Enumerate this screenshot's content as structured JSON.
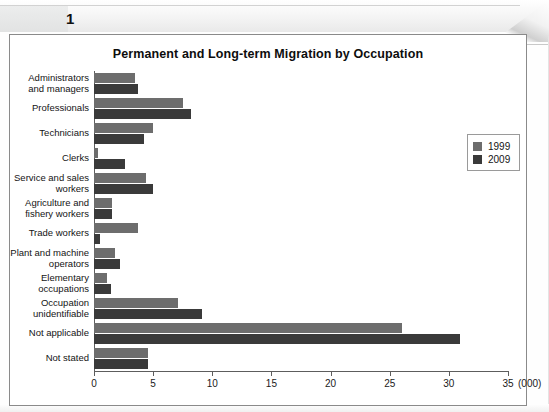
{
  "page": {
    "number": "1"
  },
  "figure": {
    "title": "Permanent and Long-term Migration by Occupation",
    "x_unit": "(000)"
  },
  "legend": {
    "items": [
      {
        "label": "1999",
        "color": "#6d6d6d"
      },
      {
        "label": "2009",
        "color": "#3a3a3a"
      }
    ]
  },
  "axis": {
    "ticks": [
      "0",
      "5",
      "10",
      "15",
      "20",
      "25",
      "30",
      "35"
    ]
  },
  "chart_data": {
    "type": "bar",
    "orientation": "horizontal",
    "title": "Permanent and Long-term Migration by Occupation",
    "xlabel": "(000)",
    "ylabel": "",
    "xlim": [
      0,
      35
    ],
    "xticks": [
      0,
      5,
      10,
      15,
      20,
      25,
      30,
      35
    ],
    "grid": false,
    "legend_position": "upper right",
    "categories": [
      "Administrators\nand managers",
      "Professionals",
      "Technicians",
      "Clerks",
      "Service and sales\nworkers",
      "Agriculture and\nfishery workers",
      "Trade workers",
      "Plant and machine\noperators",
      "Elementary\noccupations",
      "Occupation\nunidentifiable",
      "Not applicable",
      "Not stated"
    ],
    "series": [
      {
        "name": "1999",
        "color": "#6d6d6d",
        "values": [
          3.5,
          7.5,
          5.0,
          0.3,
          4.4,
          1.5,
          3.7,
          1.8,
          1.1,
          7.1,
          26.0,
          4.6
        ]
      },
      {
        "name": "2009",
        "color": "#3a3a3a",
        "values": [
          3.7,
          8.2,
          4.2,
          2.6,
          5.0,
          1.5,
          0.5,
          2.2,
          1.4,
          9.1,
          30.9,
          4.6
        ]
      }
    ]
  }
}
